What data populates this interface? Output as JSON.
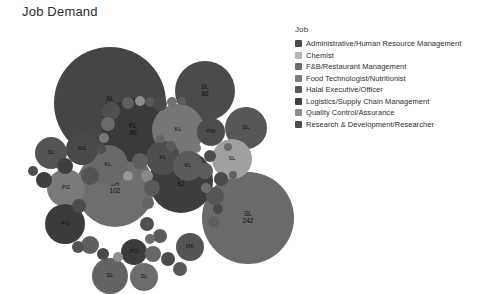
{
  "title": "Job Demand",
  "legend": {
    "heading": "Job",
    "items": [
      {
        "label": "Administrative/Human Resource Management",
        "color": "#4a4a4a"
      },
      {
        "label": "Chemist",
        "color": "#b4b4b4"
      },
      {
        "label": "F&B/Restaurant Management",
        "color": "#6e6e6e"
      },
      {
        "label": "Food Technologist/Nutritionist",
        "color": "#7d7d7d"
      },
      {
        "label": "Halal Executive/Officer",
        "color": "#585858"
      },
      {
        "label": "Logistics/Supply Chain Management",
        "color": "#3f3f3f"
      },
      {
        "label": "Quality Control/Assurance",
        "color": "#8a8a8a"
      },
      {
        "label": "Research & Development/Researcher",
        "color": "#4f4f4f"
      }
    ]
  },
  "chart_data": {
    "type": "bubble",
    "title": "Job Demand",
    "xlabel": "",
    "ylabel": "",
    "legend_position": "right",
    "grid": false,
    "note": "Circle-packing bubble chart; bubble area encodes job demand count, label is state/region code, colour encodes Job category.",
    "bubbles": [
      {
        "label": "SL",
        "value": 173,
        "cx": 110,
        "cy": 75,
        "r": 56,
        "color": "#454545"
      },
      {
        "label": "SL",
        "value": 242,
        "cx": 248,
        "cy": 190,
        "r": 46,
        "color": "#6a6a6a"
      },
      {
        "label": "JH",
        "value": 102,
        "cx": 115,
        "cy": 160,
        "r": 39,
        "color": "#6e6e6e"
      },
      {
        "label": "SL",
        "value": 86,
        "cx": 205,
        "cy": 63,
        "r": 30,
        "color": "#4b4b4b"
      },
      {
        "label": "KL",
        "value": 86,
        "cx": 133,
        "cy": 102,
        "r": 32,
        "color": "#3a3a3a"
      },
      {
        "label": "JH",
        "value": 82,
        "cx": 181,
        "cy": 153,
        "r": 32,
        "color": "#3d3d3d"
      },
      {
        "label": "KL",
        "value": null,
        "cx": 178,
        "cy": 102,
        "r": 26,
        "color": "#767676"
      },
      {
        "label": "SL",
        "value": null,
        "cx": 246,
        "cy": 100,
        "r": 21,
        "color": "#575757"
      },
      {
        "label": "PW",
        "value": null,
        "cx": 211,
        "cy": 104,
        "r": 14,
        "color": "#4c4c4c"
      },
      {
        "label": "SL",
        "value": null,
        "cx": 232,
        "cy": 131,
        "r": 20,
        "color": "#a0a0a0"
      },
      {
        "label": "PG",
        "value": null,
        "cx": 66,
        "cy": 160,
        "r": 19,
        "color": "#7a7a7a"
      },
      {
        "label": "PG",
        "value": null,
        "cx": 65,
        "cy": 196,
        "r": 20,
        "color": "#3b3b3b"
      },
      {
        "label": "KL",
        "value": null,
        "cx": 108,
        "cy": 137,
        "r": 20,
        "color": "#686868"
      },
      {
        "label": "KL",
        "value": null,
        "cx": 163,
        "cy": 130,
        "r": 17,
        "color": "#4e4e4e"
      },
      {
        "label": "KL",
        "value": null,
        "cx": 188,
        "cy": 138,
        "r": 15,
        "color": "#5b5b5b"
      },
      {
        "label": "SL",
        "value": null,
        "cx": 51,
        "cy": 125,
        "r": 16,
        "color": "#545454"
      },
      {
        "label": "NS",
        "value": null,
        "cx": 82,
        "cy": 121,
        "r": 16,
        "color": "#484848"
      },
      {
        "label": "MK",
        "value": null,
        "cx": 190,
        "cy": 219,
        "r": 14,
        "color": "#555555"
      },
      {
        "label": "PG",
        "value": null,
        "cx": 134,
        "cy": 224,
        "r": 13,
        "color": "#3c3c3c"
      },
      {
        "label": "SL",
        "value": null,
        "cx": 110,
        "cy": 248,
        "r": 18,
        "color": "#636363"
      },
      {
        "label": "SL",
        "value": null,
        "cx": 144,
        "cy": 249,
        "r": 14,
        "color": "#6c6c6c"
      },
      {
        "label": "",
        "value": null,
        "cx": 111,
        "cy": 83,
        "r": 9,
        "color": "#4f4f4f"
      },
      {
        "label": "",
        "value": null,
        "cx": 128,
        "cy": 75,
        "r": 6,
        "color": "#606060"
      },
      {
        "label": "",
        "value": null,
        "cx": 140,
        "cy": 73,
        "r": 5,
        "color": "#8b8b8b"
      },
      {
        "label": "",
        "value": null,
        "cx": 150,
        "cy": 74,
        "r": 5,
        "color": "#585858"
      },
      {
        "label": "",
        "value": null,
        "cx": 160,
        "cy": 76,
        "r": 7,
        "color": "#4a4a4a"
      },
      {
        "label": "",
        "value": null,
        "cx": 172,
        "cy": 74,
        "r": 5,
        "color": "#717171"
      },
      {
        "label": "",
        "value": null,
        "cx": 182,
        "cy": 73,
        "r": 4,
        "color": "#5d5d5d"
      },
      {
        "label": "",
        "value": null,
        "cx": 190,
        "cy": 74,
        "r": 4,
        "color": "#4a4a4a"
      },
      {
        "label": "",
        "value": null,
        "cx": 108,
        "cy": 96,
        "r": 7,
        "color": "#6a6a6a"
      },
      {
        "label": "",
        "value": null,
        "cx": 104,
        "cy": 110,
        "r": 5,
        "color": "#777777"
      },
      {
        "label": "",
        "value": null,
        "cx": 101,
        "cy": 121,
        "r": 5,
        "color": "#4d4d4d"
      },
      {
        "label": "",
        "value": null,
        "cx": 65,
        "cy": 138,
        "r": 8,
        "color": "#3f3f3f"
      },
      {
        "label": "",
        "value": null,
        "cx": 90,
        "cy": 148,
        "r": 9,
        "color": "#545454"
      },
      {
        "label": "",
        "value": null,
        "cx": 140,
        "cy": 133,
        "r": 8,
        "color": "#5f5f5f"
      },
      {
        "label": "",
        "value": null,
        "cx": 147,
        "cy": 148,
        "r": 6,
        "color": "#888888"
      },
      {
        "label": "",
        "value": null,
        "cx": 136,
        "cy": 151,
        "r": 6,
        "color": "#707070"
      },
      {
        "label": "",
        "value": null,
        "cx": 128,
        "cy": 148,
        "r": 5,
        "color": "#979797"
      },
      {
        "label": "",
        "value": null,
        "cx": 152,
        "cy": 160,
        "r": 8,
        "color": "#5a5a5a"
      },
      {
        "label": "",
        "value": null,
        "cx": 148,
        "cy": 175,
        "r": 6,
        "color": "#636363"
      },
      {
        "label": "",
        "value": null,
        "cx": 210,
        "cy": 128,
        "r": 6,
        "color": "#4e4e4e"
      },
      {
        "label": "",
        "value": null,
        "cx": 205,
        "cy": 143,
        "r": 8,
        "color": "#5c5c5c"
      },
      {
        "label": "",
        "value": null,
        "cx": 221,
        "cy": 151,
        "r": 7,
        "color": "#4b4b4b"
      },
      {
        "label": "",
        "value": null,
        "cx": 215,
        "cy": 168,
        "r": 9,
        "color": "#555555"
      },
      {
        "label": "",
        "value": null,
        "cx": 228,
        "cy": 119,
        "r": 4,
        "color": "#6b6b6b"
      },
      {
        "label": "",
        "value": null,
        "cx": 233,
        "cy": 147,
        "r": 4,
        "color": "#606060"
      },
      {
        "label": "",
        "value": null,
        "cx": 90,
        "cy": 217,
        "r": 9,
        "color": "#5e5e5e"
      },
      {
        "label": "",
        "value": null,
        "cx": 103,
        "cy": 226,
        "r": 6,
        "color": "#4a4a4a"
      },
      {
        "label": "",
        "value": null,
        "cx": 118,
        "cy": 229,
        "r": 5,
        "color": "#8f8f8f"
      },
      {
        "label": "",
        "value": null,
        "cx": 153,
        "cy": 226,
        "r": 8,
        "color": "#676767"
      },
      {
        "label": "",
        "value": null,
        "cx": 168,
        "cy": 231,
        "r": 7,
        "color": "#4d4d4d"
      },
      {
        "label": "",
        "value": null,
        "cx": 180,
        "cy": 241,
        "r": 7,
        "color": "#585858"
      },
      {
        "label": "",
        "value": null,
        "cx": 160,
        "cy": 208,
        "r": 7,
        "color": "#5b5b5b"
      },
      {
        "label": "",
        "value": null,
        "cx": 147,
        "cy": 196,
        "r": 7,
        "color": "#4f4f4f"
      },
      {
        "label": "",
        "value": null,
        "cx": 150,
        "cy": 211,
        "r": 5,
        "color": "#6d6d6d"
      },
      {
        "label": "",
        "value": null,
        "cx": 79,
        "cy": 178,
        "r": 7,
        "color": "#4c4c4c"
      },
      {
        "label": "",
        "value": null,
        "cx": 78,
        "cy": 219,
        "r": 6,
        "color": "#525252"
      },
      {
        "label": "",
        "value": null,
        "cx": 214,
        "cy": 194,
        "r": 6,
        "color": "#5f5f5f"
      },
      {
        "label": "",
        "value": null,
        "cx": 218,
        "cy": 181,
        "r": 5,
        "color": "#4a4a4a"
      },
      {
        "label": "",
        "value": null,
        "cx": 206,
        "cy": 160,
        "r": 5,
        "color": "#6e6e6e"
      },
      {
        "label": "",
        "value": null,
        "cx": 171,
        "cy": 118,
        "r": 5,
        "color": "#5a5a5a"
      },
      {
        "label": "",
        "value": null,
        "cx": 196,
        "cy": 120,
        "r": 5,
        "color": "#787878"
      },
      {
        "label": "",
        "value": null,
        "cx": 160,
        "cy": 111,
        "r": 4,
        "color": "#656565"
      },
      {
        "label": "",
        "value": null,
        "cx": 33,
        "cy": 143,
        "r": 5,
        "color": "#4e4e4e"
      },
      {
        "label": "",
        "value": null,
        "cx": 44,
        "cy": 152,
        "r": 8,
        "color": "#3e3e3e"
      }
    ]
  }
}
